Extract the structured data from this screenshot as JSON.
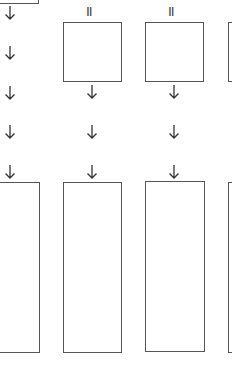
{
  "diagram": {
    "stroke_color": "#555555",
    "background": "#ffffff",
    "columns": [
      {
        "id": "col-1",
        "top_mark": "",
        "top_box": "partial (above view)",
        "arrows": 5,
        "bottom_box": "tall"
      },
      {
        "id": "col-2",
        "top_mark": "II",
        "top_box": "square",
        "arrows": 3,
        "bottom_box": "tall"
      },
      {
        "id": "col-3",
        "top_mark": "II",
        "top_box": "square",
        "arrows": 3,
        "bottom_box": "tall"
      },
      {
        "id": "col-4",
        "top_mark": "",
        "top_box": "partial (right edge)",
        "arrows": 0,
        "bottom_box": "partial (right edge)"
      }
    ],
    "marks": {
      "col2": "II",
      "col3": "II"
    }
  }
}
